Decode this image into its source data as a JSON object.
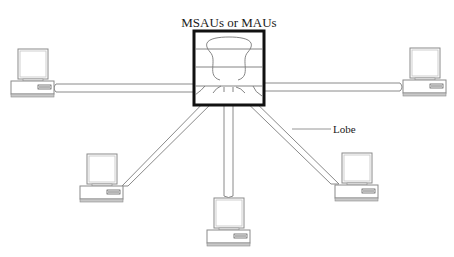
{
  "diagram": {
    "title": "MSAUs or MAUs",
    "lobe_label": "Lobe",
    "hub": {
      "name": "MSAU / MAU",
      "stroke": "#111111"
    },
    "workstations": [
      {
        "id": "left",
        "position": "left"
      },
      {
        "id": "right",
        "position": "right"
      },
      {
        "id": "lower-left",
        "position": "lower-left"
      },
      {
        "id": "bottom",
        "position": "bottom"
      },
      {
        "id": "lower-right",
        "position": "lower-right"
      }
    ],
    "colors": {
      "line": "#8a8a8a",
      "hub": "#111111",
      "text": "#1a1a1a",
      "base_stripe": "#b8b8b8"
    }
  }
}
